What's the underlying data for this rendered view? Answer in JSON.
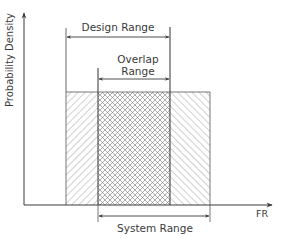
{
  "diagram": {
    "y_axis_label": "Probability Density",
    "x_axis_label": "FR",
    "design_range": {
      "label": "Design Range"
    },
    "overlap_range": {
      "label_line1": "Overlap",
      "label_line2": "Range"
    },
    "system_range": {
      "label": "System Range"
    },
    "colors": {
      "line": "#3a3a3a",
      "hatch": "#666666",
      "background": "#ffffff"
    }
  }
}
